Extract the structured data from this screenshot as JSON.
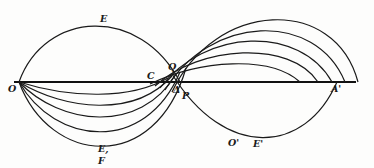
{
  "figure": {
    "labels": {
      "O": "O",
      "E": "E",
      "Q": "Q",
      "C": "C",
      "Delta": "Δ",
      "P": "P",
      "E1": "E,",
      "F": "F",
      "O_prime": "O'",
      "E_prime": "E'",
      "A_prime": "A'"
    },
    "colors": {
      "ink": "#1a1a1a",
      "paper": "#fdfdfc"
    }
  }
}
